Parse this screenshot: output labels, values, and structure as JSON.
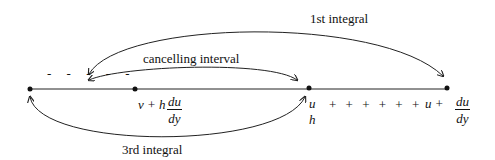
{
  "labels": {
    "first_integral": "1st integral",
    "cancelling_interval": "cancelling interval",
    "third_integral": "3rd integral"
  },
  "point_labels": {
    "point2_expr": "v + h",
    "point2_frac_num": "du",
    "point2_frac_den": "dy",
    "point3_top": "u",
    "point3_bottom": "h",
    "plus_series": "+ + + + + +",
    "point4_expr": "u +",
    "point4_frac_num": "du",
    "point4_frac_den": "dy"
  },
  "left_dashes": "- - - - -",
  "colors": {
    "stroke": "#222222",
    "background": "#ffffff"
  }
}
